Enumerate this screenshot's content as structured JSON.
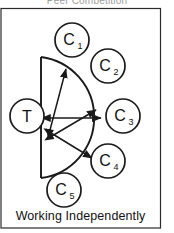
{
  "figure": {
    "top_caption": "Peer Competition",
    "bottom_caption": "Working Independently",
    "frame_color": "#2b2b2b",
    "ink_color": "#1a1a1a",
    "background_color": "#ffffff"
  },
  "nodes": [
    {
      "id": "teacher",
      "label": "T",
      "sub": "",
      "cx": 27,
      "cy": 116,
      "r": 17
    },
    {
      "id": "child-1",
      "label": "C",
      "sub": "1",
      "cx": 72,
      "cy": 40,
      "r": 17
    },
    {
      "id": "child-2",
      "label": "C",
      "sub": "2",
      "cx": 108,
      "cy": 66,
      "r": 17
    },
    {
      "id": "child-3",
      "label": "C",
      "sub": "3",
      "cx": 123,
      "cy": 116,
      "r": 17
    },
    {
      "id": "child-4",
      "label": "C",
      "sub": "4",
      "cx": 108,
      "cy": 161,
      "r": 17
    },
    {
      "id": "child-5",
      "label": "C",
      "sub": "5",
      "cx": 64,
      "cy": 190,
      "r": 17
    }
  ],
  "group_shape": {
    "name": "teacher-group-boundary",
    "description": "vertical flat side with semicircular arc",
    "top_x": 41,
    "top_y": 57,
    "bottom_x": 41,
    "bottom_y": 178,
    "arc_radius": 61
  },
  "arrows": [
    {
      "id": "arrow-upper",
      "x1": 50,
      "y1": 130,
      "x2": 66,
      "y2": 69
    },
    {
      "id": "arrow-middle",
      "x1": 52,
      "y1": 135,
      "x2": 96,
      "y2": 110
    },
    {
      "id": "arrow-horizontal",
      "x1": 50,
      "y1": 118,
      "x2": 101,
      "y2": 118
    },
    {
      "id": "arrow-lower",
      "x1": 50,
      "y1": 133,
      "x2": 92,
      "y2": 158
    }
  ],
  "labels": {
    "node_label_font_size": 16,
    "sub_font_size": 9
  }
}
